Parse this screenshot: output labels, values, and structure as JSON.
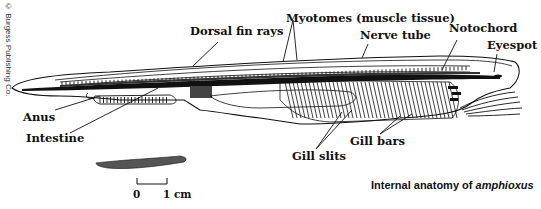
{
  "copyright": "© Burgess Publishing Co.",
  "labels": {
    "dorsal_fin_rays": "Dorsal fin rays",
    "myotomes": "Myotomes (muscle tissue)",
    "nerve_tube": "Nerve tube",
    "notochord": "Notochord",
    "eyespot": "Eyespot",
    "anus": "Anus",
    "intestine": "Intestine",
    "gill_slits": "Gill slits",
    "gill_bars": "Gill bars"
  },
  "scale_bar": {
    "start": "0",
    "end": "1 cm"
  },
  "caption": {
    "prefix": "Internal anatomy of ",
    "species": "amphioxus"
  },
  "colors": {
    "ink": "#111111",
    "background": "#ffffff"
  }
}
